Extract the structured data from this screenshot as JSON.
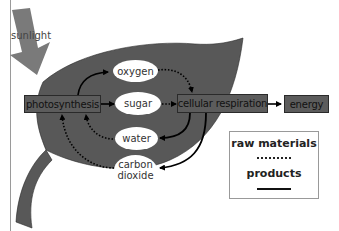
{
  "diagram": {
    "sunlight_label": "sunlight",
    "processes": {
      "photosynthesis": "photosynthesis",
      "cellular_respiration": "cellular respiration",
      "energy": "energy"
    },
    "substances": {
      "oxygen": "oxygen",
      "sugar": "sugar",
      "water": "water",
      "carbon_dioxide_line1": "carbon",
      "carbon_dioxide_line2": "dioxide"
    },
    "legend": {
      "raw_materials": "raw materials",
      "products": "products",
      "raw_materials_style": "dotted",
      "products_style": "solid"
    },
    "colors": {
      "leaf": "#5a5a5a",
      "box": "#5c5c5c",
      "sun_arrow": "#7a7a7a",
      "oval": "#ffffff"
    },
    "edges": [
      {
        "from": "photosynthesis",
        "to": "oxygen",
        "type": "product"
      },
      {
        "from": "photosynthesis",
        "to": "sugar",
        "type": "product"
      },
      {
        "from": "oxygen",
        "to": "cellular respiration",
        "type": "raw material"
      },
      {
        "from": "sugar",
        "to": "cellular respiration",
        "type": "raw material"
      },
      {
        "from": "cellular respiration",
        "to": "energy",
        "type": "product"
      },
      {
        "from": "cellular respiration",
        "to": "water",
        "type": "product"
      },
      {
        "from": "cellular respiration",
        "to": "carbon dioxide",
        "type": "product"
      },
      {
        "from": "water",
        "to": "photosynthesis",
        "type": "raw material"
      },
      {
        "from": "carbon dioxide",
        "to": "photosynthesis",
        "type": "raw material"
      },
      {
        "from": "sunlight",
        "to": "photosynthesis",
        "type": "input"
      }
    ]
  }
}
